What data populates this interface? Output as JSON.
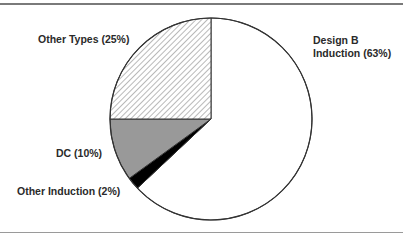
{
  "chart_data": {
    "type": "pie",
    "title": "",
    "start_angle_deg": 0,
    "direction": "clockwise",
    "slices": [
      {
        "label": "Design B Induction",
        "value": 63,
        "fill": "#ffffff",
        "pattern": "none"
      },
      {
        "label": "Other Induction",
        "value": 2,
        "fill": "#000000",
        "pattern": "none"
      },
      {
        "label": "DC",
        "value": 10,
        "fill": "#999999",
        "pattern": "none"
      },
      {
        "label": "Other Types",
        "value": 25,
        "fill": "#ffffff",
        "pattern": "diagonal-hatch"
      }
    ],
    "legend": "none (direct labels)"
  },
  "labels": {
    "design_b_line1": "Design B",
    "design_b_line2": "Induction (63%)",
    "other_types": "Other Types (25%)",
    "dc": "DC (10%)",
    "other_induction": "Other Induction (2%)"
  },
  "colors": {
    "outline": "#333333",
    "dc_gray": "#999999",
    "other_induction_black": "#000000",
    "hatch_line": "#888888",
    "rule": "#7a7a7a"
  }
}
